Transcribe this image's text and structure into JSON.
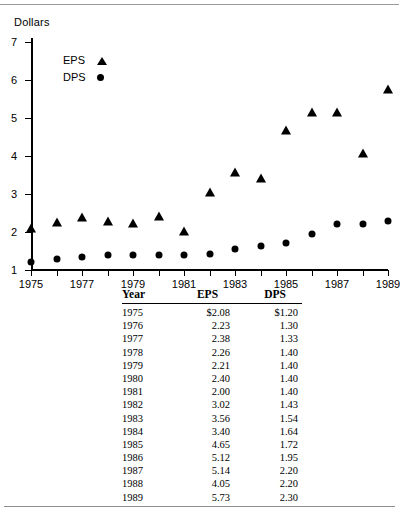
{
  "chart_data": {
    "type": "scatter",
    "title": "",
    "xlabel": "",
    "ylabel": "Dollars",
    "x": [
      1975,
      1976,
      1977,
      1978,
      1979,
      1980,
      1981,
      1982,
      1983,
      1984,
      1985,
      1986,
      1987,
      1988,
      1989
    ],
    "xlim": [
      1975,
      1989
    ],
    "ylim": [
      1,
      7
    ],
    "xticks": [
      1975,
      1976,
      1977,
      1978,
      1979,
      1980,
      1981,
      1982,
      1983,
      1984,
      1985,
      1986,
      1987,
      1988,
      1989
    ],
    "xtick_labels": [
      "1975",
      "",
      "1977",
      "",
      "1979",
      "",
      "1981",
      "",
      "1983",
      "",
      "1985",
      "",
      "1987",
      "",
      "1989"
    ],
    "yticks": [
      1,
      2,
      3,
      4,
      5,
      6,
      7
    ],
    "ytick_labels": [
      "1",
      "2",
      "3",
      "4",
      "5",
      "6",
      "7"
    ],
    "grid": false,
    "legend_position": "upper-left-inside",
    "series": [
      {
        "name": "EPS",
        "marker": "triangle",
        "values": [
          2.08,
          2.23,
          2.38,
          2.26,
          2.21,
          2.4,
          2.0,
          3.02,
          3.56,
          3.4,
          4.65,
          5.12,
          5.14,
          4.05,
          5.73
        ]
      },
      {
        "name": "DPS",
        "marker": "circle",
        "values": [
          1.2,
          1.3,
          1.33,
          1.4,
          1.4,
          1.4,
          1.4,
          1.43,
          1.54,
          1.64,
          1.72,
          1.95,
          2.2,
          2.2,
          2.3
        ]
      }
    ]
  },
  "legend": {
    "items": [
      {
        "label": "EPS",
        "marker": "triangle"
      },
      {
        "label": "DPS",
        "marker": "circle"
      }
    ]
  },
  "table": {
    "columns": [
      "Year",
      "EPS",
      "DPS"
    ],
    "rows": [
      {
        "year": "1975",
        "eps": "$2.08",
        "dps": "$1.20"
      },
      {
        "year": "1976",
        "eps": "2.23",
        "dps": "1.30"
      },
      {
        "year": "1977",
        "eps": "2.38",
        "dps": "1.33"
      },
      {
        "year": "1978",
        "eps": "2.26",
        "dps": "1.40"
      },
      {
        "year": "1979",
        "eps": "2.21",
        "dps": "1.40"
      },
      {
        "year": "1980",
        "eps": "2.40",
        "dps": "1.40"
      },
      {
        "year": "1981",
        "eps": "2.00",
        "dps": "1.40"
      },
      {
        "year": "1982",
        "eps": "3.02",
        "dps": "1.43"
      },
      {
        "year": "1983",
        "eps": "3.56",
        "dps": "1.54"
      },
      {
        "year": "1984",
        "eps": "3.40",
        "dps": "1.64"
      },
      {
        "year": "1985",
        "eps": "4.65",
        "dps": "1.72"
      },
      {
        "year": "1986",
        "eps": "5.12",
        "dps": "1.95"
      },
      {
        "year": "1987",
        "eps": "5.14",
        "dps": "2.20"
      },
      {
        "year": "1988",
        "eps": "4.05",
        "dps": "2.20"
      },
      {
        "year": "1989",
        "eps": "5.73",
        "dps": "2.30"
      }
    ]
  }
}
